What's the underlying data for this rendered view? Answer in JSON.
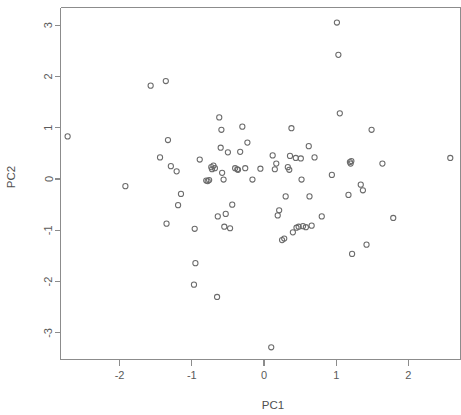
{
  "chart_data": {
    "type": "scatter",
    "title": "",
    "xlabel": "PC1",
    "ylabel": "PC2",
    "xlim": [
      -2.85,
      2.75
    ],
    "ylim": [
      -3.45,
      3.35
    ],
    "xticks": [
      -2,
      -1,
      0,
      1,
      2
    ],
    "xtick_labels": [
      "-2",
      "-1",
      "0",
      "1",
      "2"
    ],
    "yticks": [
      -3,
      -2,
      -1,
      0,
      1,
      2,
      3
    ],
    "ytick_labels": [
      "-3",
      "-2",
      "-1",
      "0",
      "1",
      "2",
      "3"
    ],
    "grid": false,
    "legend": null,
    "marker": "open-circle",
    "marker_color": "#6b6b6b",
    "n_points": 85,
    "points": [
      {
        "x": -2.72,
        "y": 0.83
      },
      {
        "x": -1.92,
        "y": -0.14
      },
      {
        "x": -1.57,
        "y": 1.82
      },
      {
        "x": -1.36,
        "y": 1.91
      },
      {
        "x": -1.33,
        "y": 0.76
      },
      {
        "x": -1.44,
        "y": 0.42
      },
      {
        "x": -1.29,
        "y": 0.25
      },
      {
        "x": -1.21,
        "y": 0.15
      },
      {
        "x": -1.35,
        "y": -0.87
      },
      {
        "x": -1.19,
        "y": -0.51
      },
      {
        "x": -1.15,
        "y": -0.29
      },
      {
        "x": -0.96,
        "y": -0.97
      },
      {
        "x": -0.95,
        "y": -1.64
      },
      {
        "x": -0.97,
        "y": -2.06
      },
      {
        "x": -0.89,
        "y": 0.38
      },
      {
        "x": -0.8,
        "y": -0.03
      },
      {
        "x": -0.78,
        "y": -0.04
      },
      {
        "x": -0.76,
        "y": -0.02
      },
      {
        "x": -0.73,
        "y": 0.23
      },
      {
        "x": -0.72,
        "y": 0.19
      },
      {
        "x": -0.65,
        "y": -2.3
      },
      {
        "x": -0.64,
        "y": -0.73
      },
      {
        "x": -0.62,
        "y": 1.2
      },
      {
        "x": -0.59,
        "y": 0.96
      },
      {
        "x": -0.6,
        "y": 0.61
      },
      {
        "x": -0.58,
        "y": 0.12
      },
      {
        "x": -0.56,
        "y": -0.01
      },
      {
        "x": -0.55,
        "y": -0.93
      },
      {
        "x": -0.53,
        "y": -0.68
      },
      {
        "x": -0.5,
        "y": 0.52
      },
      {
        "x": -0.47,
        "y": -0.96
      },
      {
        "x": -0.44,
        "y": -0.5
      },
      {
        "x": -0.4,
        "y": 0.21
      },
      {
        "x": -0.37,
        "y": 0.19
      },
      {
        "x": -0.36,
        "y": 0.18
      },
      {
        "x": -0.33,
        "y": 0.53
      },
      {
        "x": -0.3,
        "y": 1.02
      },
      {
        "x": -0.26,
        "y": 0.21
      },
      {
        "x": -0.23,
        "y": 0.71
      },
      {
        "x": -0.16,
        "y": -0.01
      },
      {
        "x": 0.1,
        "y": -3.28
      },
      {
        "x": 0.12,
        "y": 0.46
      },
      {
        "x": 0.17,
        "y": 0.3
      },
      {
        "x": 0.19,
        "y": -0.71
      },
      {
        "x": 0.21,
        "y": -0.61
      },
      {
        "x": 0.25,
        "y": -1.19
      },
      {
        "x": 0.28,
        "y": -1.16
      },
      {
        "x": 0.3,
        "y": -0.34
      },
      {
        "x": 0.33,
        "y": 0.23
      },
      {
        "x": 0.35,
        "y": 0.18
      },
      {
        "x": 0.36,
        "y": 0.45
      },
      {
        "x": 0.38,
        "y": 0.99
      },
      {
        "x": 0.4,
        "y": -1.04
      },
      {
        "x": 0.44,
        "y": 0.41
      },
      {
        "x": 0.45,
        "y": -0.95
      },
      {
        "x": 0.48,
        "y": -0.93
      },
      {
        "x": 0.51,
        "y": 0.4
      },
      {
        "x": 0.52,
        "y": -0.01
      },
      {
        "x": 0.54,
        "y": -0.92
      },
      {
        "x": 0.58,
        "y": -0.94
      },
      {
        "x": 0.62,
        "y": 0.64
      },
      {
        "x": 0.63,
        "y": -0.34
      },
      {
        "x": 0.66,
        "y": -0.91
      },
      {
        "x": 0.7,
        "y": 0.42
      },
      {
        "x": 0.8,
        "y": -0.73
      },
      {
        "x": 0.94,
        "y": 0.08
      },
      {
        "x": 1.01,
        "y": 3.05
      },
      {
        "x": 1.03,
        "y": 2.42
      },
      {
        "x": 1.05,
        "y": 1.28
      },
      {
        "x": 1.17,
        "y": -0.31
      },
      {
        "x": 1.19,
        "y": 0.33
      },
      {
        "x": 1.2,
        "y": 0.3
      },
      {
        "x": 1.21,
        "y": 0.35
      },
      {
        "x": 1.22,
        "y": -1.46
      },
      {
        "x": 1.34,
        "y": -0.11
      },
      {
        "x": 1.37,
        "y": -0.22
      },
      {
        "x": 1.42,
        "y": -1.28
      },
      {
        "x": 1.49,
        "y": 0.96
      },
      {
        "x": 1.64,
        "y": 0.3
      },
      {
        "x": 1.79,
        "y": -0.76
      },
      {
        "x": 2.58,
        "y": 0.41
      },
      {
        "x": -0.7,
        "y": 0.26
      },
      {
        "x": -0.68,
        "y": 0.21
      },
      {
        "x": -0.05,
        "y": 0.2
      },
      {
        "x": 0.15,
        "y": 0.19
      }
    ]
  },
  "figure": {
    "background_color": "#ffffff",
    "axis_color": "#8c8c8c",
    "text_color": "#4f4f4f"
  }
}
